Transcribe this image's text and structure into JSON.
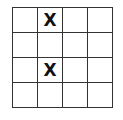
{
  "board": {
    "rows": 4,
    "cols": 4,
    "cells": [
      [
        "",
        "X",
        "",
        ""
      ],
      [
        "",
        "",
        "",
        ""
      ],
      [
        "",
        "X",
        "",
        ""
      ],
      [
        "",
        "",
        "",
        ""
      ]
    ]
  }
}
